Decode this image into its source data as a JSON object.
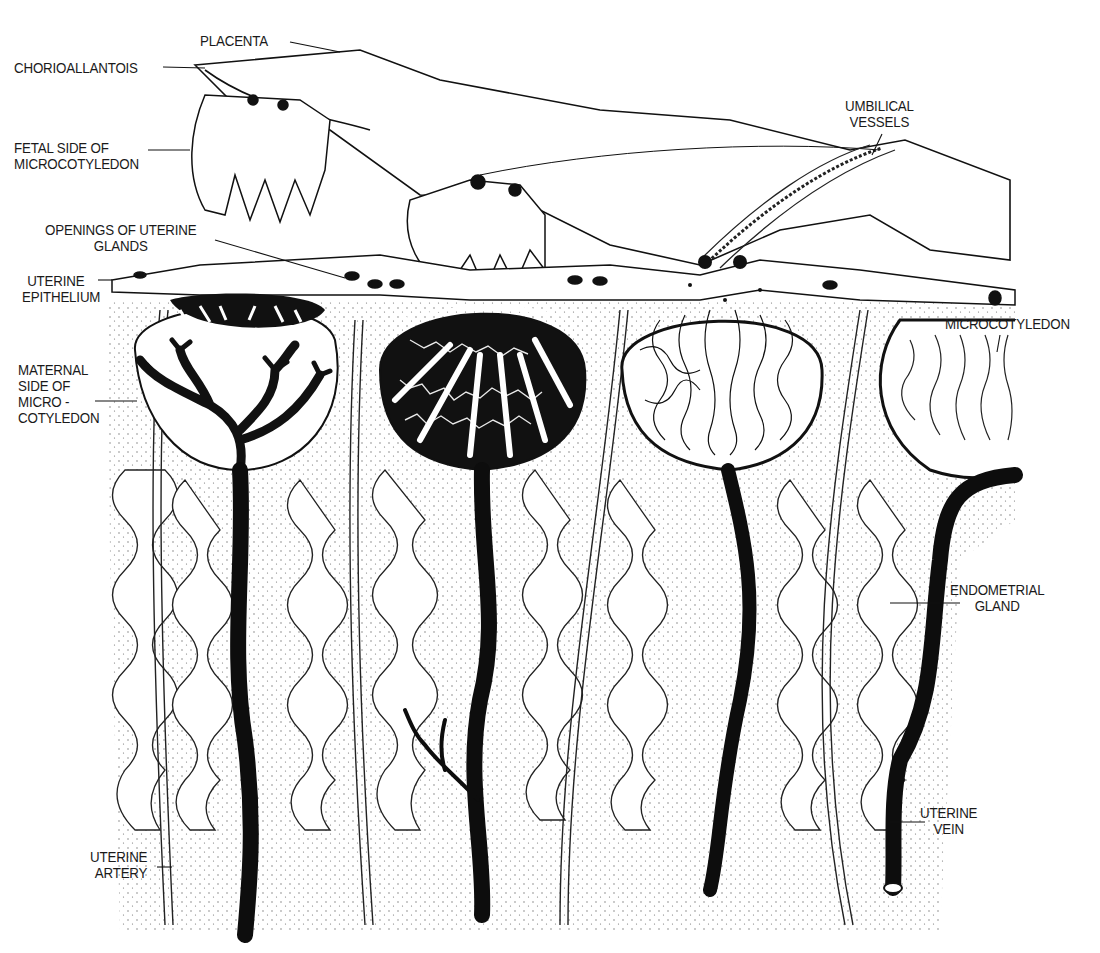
{
  "figure": {
    "colors": {
      "ink": "#111111",
      "paper": "#ffffff",
      "stipple": "#555555"
    }
  },
  "labels": {
    "placenta": {
      "lines": [
        "PLACENTA"
      ]
    },
    "chorioallantois": {
      "lines": [
        "CHORIOALLANTOIS"
      ]
    },
    "fetal_side": {
      "lines": [
        "FETAL SIDE OF",
        "MICROCOTYLEDON"
      ]
    },
    "openings": {
      "lines": [
        "OPENINGS OF UTERINE",
        "GLANDS"
      ]
    },
    "uterine_epithelium": {
      "lines": [
        "UTERINE",
        "EPITHELIUM"
      ]
    },
    "maternal_side": {
      "lines": [
        "MATERNAL",
        "SIDE OF",
        "MICRO -",
        "COTYLEDON"
      ]
    },
    "umbilical_vessels": {
      "lines": [
        "UMBILICAL",
        "VESSELS"
      ]
    },
    "microcotyledon": {
      "lines": [
        "MICROCOTYLEDON"
      ]
    },
    "endometrial_gland": {
      "lines": [
        "ENDOMETRIAL",
        "GLAND"
      ]
    },
    "uterine_vein": {
      "lines": [
        "UTERINE",
        "VEIN"
      ]
    },
    "uterine_artery": {
      "lines": [
        "UTERINE",
        "ARTERY"
      ]
    }
  }
}
